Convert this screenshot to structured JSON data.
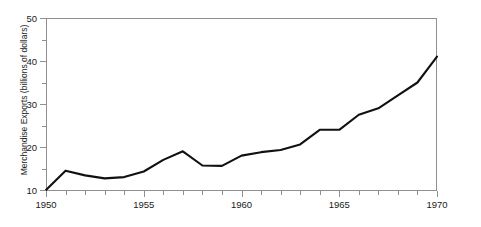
{
  "figure": {
    "caption_fragment_left": "",
    "caption_fragment_top": "",
    "ylabel": "Merchandise Exports (billions of dollars)"
  },
  "axes": {
    "y_tick_labels": [
      "50",
      "40",
      "30",
      "20",
      "10"
    ],
    "x_tick_labels": [
      "1950",
      "1955",
      "1960",
      "1965",
      "1970"
    ]
  },
  "chart_data": {
    "type": "line",
    "title": "",
    "xlabel": "",
    "ylabel": "Merchandise Exports (billions of dollars)",
    "xlim": [
      1950,
      1970
    ],
    "ylim": [
      10,
      50
    ],
    "y_ticks": [
      10,
      20,
      30,
      40,
      50
    ],
    "y_minor_tick_step": 5,
    "x_ticks": [
      1950,
      1955,
      1960,
      1965,
      1970
    ],
    "x_minor_tick_step": 1,
    "grid": false,
    "legend": null,
    "line_color": "#111111",
    "line_width": 2.1,
    "x": [
      1950,
      1951,
      1952,
      1953,
      1954,
      1955,
      1956,
      1957,
      1958,
      1959,
      1960,
      1961,
      1962,
      1963,
      1964,
      1965,
      1966,
      1967,
      1968,
      1969,
      1970
    ],
    "values": [
      10.0,
      14.5,
      13.4,
      12.7,
      13.0,
      14.3,
      17.0,
      19.0,
      15.7,
      15.6,
      18.0,
      18.8,
      19.3,
      20.6,
      24.0,
      24.0,
      27.5,
      29.0,
      32.0,
      35.0,
      41.0
    ]
  }
}
